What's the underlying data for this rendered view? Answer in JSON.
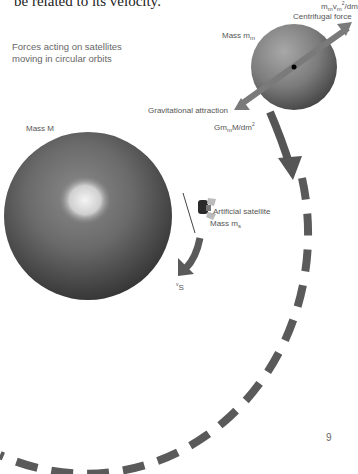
{
  "page": {
    "top_text": "be related to its velocity.",
    "caption_lines": [
      "Forces acting on satellites",
      "moving in circular orbits"
    ],
    "page_number": "9"
  },
  "labels": {
    "moon_mass_prefix": "Mass m",
    "moon_mass_sub": "m",
    "centrifugal_formula_m": "m",
    "centrifugal_formula_sub1": "m",
    "centrifugal_formula_v": "v",
    "centrifugal_formula_sub2": "m",
    "centrifugal_formula_sup": "2",
    "centrifugal_formula_rest": "/dm",
    "centrifugal_force": "Centrifugal force",
    "gravitational_attraction": "Gravitational attraction",
    "grav_formula_G": "Gm",
    "grav_formula_sub": "m",
    "grav_formula_rest": "M/dm",
    "grav_formula_sup": "2",
    "earth_mass": "Mass M",
    "satellite_name": "Artificial satellite",
    "satellite_mass_prefix": "Mass m",
    "satellite_mass_sub": "s",
    "velocity_v": "v",
    "velocity_sub": "S"
  },
  "colors": {
    "arrow": "#5f5f5f",
    "orbit": "#5a5a5a",
    "moon_light": "#9a9a9a",
    "moon_dark": "#4a4a4a",
    "earth_light": "#7a7a7a",
    "earth_dark": "#2e2e2e"
  }
}
